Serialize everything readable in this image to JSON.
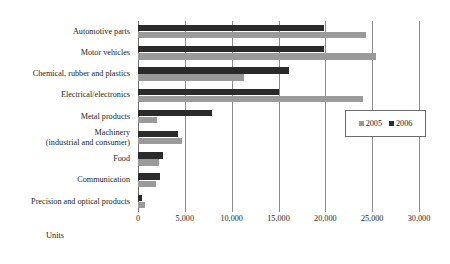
{
  "page": {
    "header_ghost": ""
  },
  "legend": {
    "position": "inside-right",
    "items": [
      {
        "label": "2005",
        "color": "#9a9a9a",
        "swatch_name": "legend-swatch-2005"
      },
      {
        "label": "2006",
        "color": "#2b2b2b",
        "swatch_name": "legend-swatch-2006"
      }
    ]
  },
  "axis": {
    "x_title": "Units",
    "x_ticks": [
      "0",
      "5,000",
      "10,000",
      "15,000",
      "20,000",
      "25,000",
      "30,000"
    ]
  },
  "chart_data": {
    "type": "bar",
    "orientation": "horizontal",
    "title": "",
    "subtitle": "",
    "xlabel": "Units",
    "ylabel": "",
    "xlim": [
      0,
      30000
    ],
    "grid": true,
    "legend_position": "inside-right",
    "categories": [
      "Automotive parts",
      "Motor vehicles",
      "Chemical, rubber and plastics",
      "Electrical/electronics",
      "Metal products",
      "Machinery (industrial and consumer)",
      "Food",
      "Communication",
      "Precision and optical products"
    ],
    "category_labels_display": [
      "Automotive parts",
      "Motor vehicles",
      "Chemical, rubber and plastics",
      "Electrical/electronics",
      "Metal products",
      "Machinery\n(industrial and consumer)",
      "Food",
      "Communication",
      "Precision and optical products"
    ],
    "series": [
      {
        "name": "2005",
        "color": "#9a9a9a",
        "values": [
          24300,
          25400,
          11300,
          24000,
          2000,
          4700,
          2200,
          1900,
          700
        ]
      },
      {
        "name": "2006",
        "color": "#2b2b2b",
        "values": [
          19900,
          19900,
          16100,
          15000,
          7900,
          4300,
          2700,
          2400,
          400
        ]
      }
    ]
  }
}
